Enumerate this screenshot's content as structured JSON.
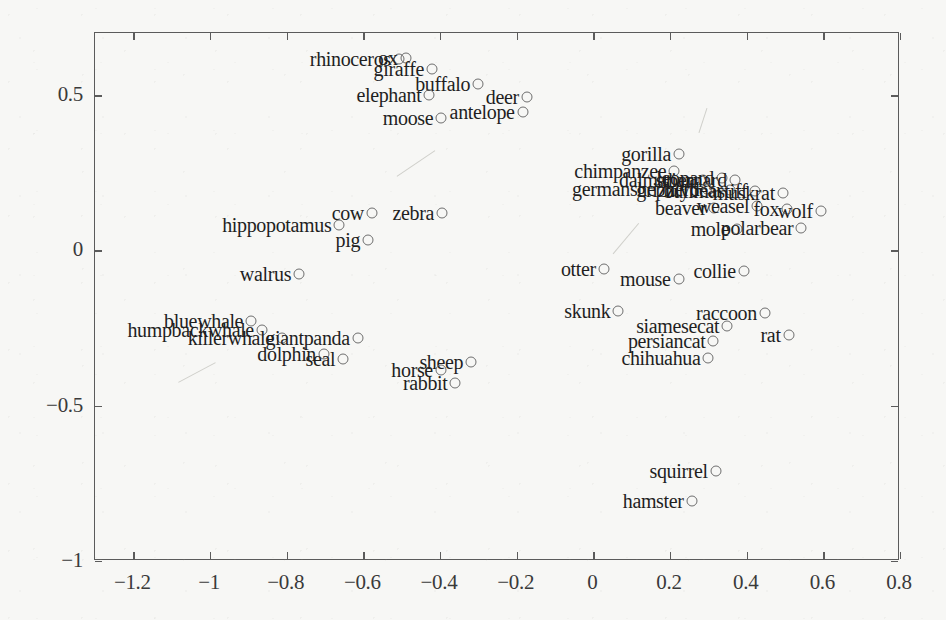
{
  "figure": {
    "kind": "scatter-plot",
    "background_color": "#f7f7f5",
    "marker_color": "#6e6e6e",
    "text_color": "#1f1f1f",
    "axis_color": "#5b5b5b"
  },
  "chart_data": {
    "type": "scatter",
    "title": "",
    "xlabel": "",
    "ylabel": "",
    "xlim": [
      -1.3,
      0.8
    ],
    "ylim": [
      -1.0,
      0.7
    ],
    "grid": false,
    "legend": "none",
    "xticks": [
      -1.2,
      -1,
      -0.8,
      -0.6,
      -0.4,
      -0.2,
      0,
      0.2,
      0.4,
      0.6,
      0.8
    ],
    "xticklabels": [
      "−1.2",
      "−1",
      "−0.8",
      "−0.6",
      "−0.4",
      "−0.2",
      "0",
      "0.2",
      "0.4",
      "0.6",
      "0.8"
    ],
    "yticks": [
      0.5,
      0,
      -0.5,
      -1
    ],
    "yticklabels": [
      "0.5",
      "0",
      "−0.5",
      "−1"
    ],
    "point_label_position": "left-of-marker",
    "points": [
      {
        "label": "rhinoceros",
        "x": -0.505,
        "y": 0.612
      },
      {
        "label": "ox",
        "x": -0.487,
        "y": 0.615
      },
      {
        "label": "giraffe",
        "x": -0.418,
        "y": 0.581
      },
      {
        "label": "buffalo",
        "x": -0.298,
        "y": 0.533
      },
      {
        "label": "elephant",
        "x": -0.425,
        "y": 0.497
      },
      {
        "label": "deer",
        "x": -0.171,
        "y": 0.491
      },
      {
        "label": "antelope",
        "x": -0.182,
        "y": 0.443
      },
      {
        "label": "moose",
        "x": -0.394,
        "y": 0.424
      },
      {
        "label": "gorilla",
        "x": 0.226,
        "y": 0.306
      },
      {
        "label": "chimpanzee",
        "x": 0.214,
        "y": 0.254
      },
      {
        "label": "dalmatian",
        "x": 0.288,
        "y": 0.225
      },
      {
        "label": "leopard",
        "x": 0.338,
        "y": 0.231
      },
      {
        "label": "stbernard",
        "x": 0.372,
        "y": 0.222
      },
      {
        "label": "germanshepherd",
        "x": 0.3,
        "y": 0.196
      },
      {
        "label": "grizzlybear",
        "x": 0.36,
        "y": 0.19
      },
      {
        "label": "bullmastiff",
        "x": 0.425,
        "y": 0.188
      },
      {
        "label": "muskrat",
        "x": 0.497,
        "y": 0.182
      },
      {
        "label": "cow",
        "x": -0.575,
        "y": 0.116
      },
      {
        "label": "zebra",
        "x": -0.392,
        "y": 0.118
      },
      {
        "label": "beaver",
        "x": 0.318,
        "y": 0.133
      },
      {
        "label": "weasel",
        "x": 0.43,
        "y": 0.139
      },
      {
        "label": "fox",
        "x": 0.508,
        "y": 0.131
      },
      {
        "label": "wolf",
        "x": 0.596,
        "y": 0.125
      },
      {
        "label": "hippopotamus",
        "x": -0.66,
        "y": 0.08
      },
      {
        "label": "mole",
        "x": 0.378,
        "y": 0.066
      },
      {
        "label": "polarbear",
        "x": 0.545,
        "y": 0.068
      },
      {
        "label": "pig",
        "x": -0.585,
        "y": 0.03
      },
      {
        "label": "otter",
        "x": 0.03,
        "y": -0.062
      },
      {
        "label": "collie",
        "x": 0.395,
        "y": -0.07
      },
      {
        "label": "walrus",
        "x": -0.765,
        "y": -0.078
      },
      {
        "label": "mouse",
        "x": 0.225,
        "y": -0.095
      },
      {
        "label": "bluewhale",
        "x": -0.89,
        "y": -0.232
      },
      {
        "label": "skunk",
        "x": 0.068,
        "y": -0.199
      },
      {
        "label": "raccoon",
        "x": 0.45,
        "y": -0.205
      },
      {
        "label": "humpbackwhale",
        "x": -0.862,
        "y": -0.258
      },
      {
        "label": "siamesecat",
        "x": 0.352,
        "y": -0.247
      },
      {
        "label": "killerwhale",
        "x": -0.81,
        "y": -0.286
      },
      {
        "label": "giantpanda",
        "x": -0.612,
        "y": -0.284
      },
      {
        "label": "persiancat",
        "x": 0.316,
        "y": -0.296
      },
      {
        "label": "rat",
        "x": 0.512,
        "y": -0.277
      },
      {
        "label": "dolphin",
        "x": -0.7,
        "y": -0.336
      },
      {
        "label": "seal",
        "x": -0.65,
        "y": -0.352
      },
      {
        "label": "sheep",
        "x": -0.316,
        "y": -0.362
      },
      {
        "label": "chihuahua",
        "x": 0.303,
        "y": -0.35
      },
      {
        "label": "horse",
        "x": -0.395,
        "y": -0.388
      },
      {
        "label": "rabbit",
        "x": -0.357,
        "y": -0.429
      },
      {
        "label": "squirrel",
        "x": 0.322,
        "y": -0.712
      },
      {
        "label": "hamster",
        "x": 0.259,
        "y": -0.81
      }
    ]
  }
}
